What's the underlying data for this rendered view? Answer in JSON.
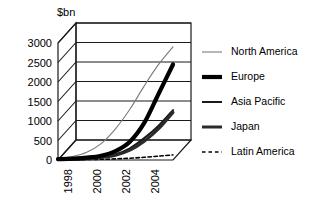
{
  "chart_data": {
    "type": "line",
    "title": "",
    "xlabel": "",
    "ylabel": "$bn",
    "ylim": [
      0,
      3000
    ],
    "yticks": [
      0,
      500,
      1000,
      1500,
      2000,
      2500,
      3000
    ],
    "xticks": [
      "1998",
      "2000",
      "2002",
      "2004"
    ],
    "x": [
      1997,
      1998,
      1999,
      2000,
      2001,
      2002,
      2003,
      2004,
      2005
    ],
    "grid": true,
    "legend_position": "right",
    "projection": "3d",
    "series": [
      {
        "name": "North America",
        "style": "thin",
        "color": "#7a7a7a",
        "width": 1.1,
        "values": [
          40,
          90,
          200,
          420,
          800,
          1300,
          1900,
          2450,
          2900
        ]
      },
      {
        "name": "Europe",
        "style": "extra-thick",
        "color": "#000000",
        "width": 4.2,
        "values": [
          20,
          35,
          60,
          110,
          230,
          470,
          950,
          1700,
          2450
        ]
      },
      {
        "name": "Asia Pacific",
        "style": "medium",
        "color": "#1a1a1a",
        "width": 2.0,
        "values": [
          15,
          25,
          45,
          80,
          150,
          300,
          560,
          880,
          1280
        ]
      },
      {
        "name": "Japan",
        "style": "thick",
        "color": "#2b2b2b",
        "width": 3.0,
        "values": [
          12,
          20,
          35,
          65,
          120,
          250,
          480,
          800,
          1220
        ]
      },
      {
        "name": "Latin America",
        "style": "dashed",
        "color": "#000000",
        "width": 1.6,
        "values": [
          5,
          8,
          12,
          18,
          28,
          45,
          70,
          100,
          130
        ]
      }
    ]
  },
  "legend": {
    "entries": [
      {
        "label": "North America"
      },
      {
        "label": "Europe"
      },
      {
        "label": "Asia Pacific"
      },
      {
        "label": "Japan"
      },
      {
        "label": "Latin America"
      }
    ]
  }
}
